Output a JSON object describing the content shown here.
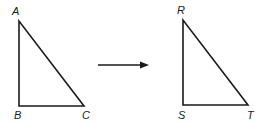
{
  "diagram": {
    "triangle_1": {
      "vertices": {
        "top": "A",
        "bottom_left": "B",
        "bottom_right": "C"
      }
    },
    "triangle_2": {
      "vertices": {
        "top": "R",
        "bottom_left": "S",
        "bottom_right": "T"
      }
    },
    "arrow": {
      "direction": "right"
    },
    "stroke_color": "#1a1a1a"
  }
}
